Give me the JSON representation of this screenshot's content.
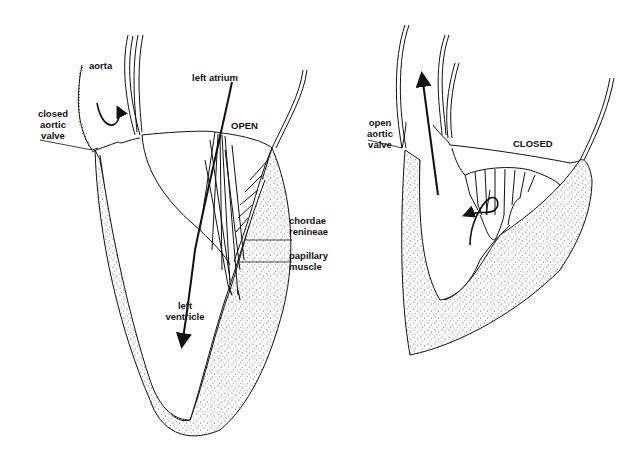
{
  "figure": {
    "colors": {
      "ink": "#111111",
      "stipple": "#444444",
      "background": "#ffffff"
    }
  },
  "left_panel": {
    "state": "diastole",
    "labels": {
      "aorta": "aorta",
      "closed_aortic_valve": [
        "closed",
        "aortic",
        "valve"
      ],
      "left_atrium": "left atrium",
      "mitral_state": "OPEN",
      "chordae": [
        "chordae",
        "renineae"
      ],
      "papillary": [
        "papillary",
        "muscle"
      ],
      "left_ventricle": [
        "left",
        "ventricle"
      ]
    }
  },
  "right_panel": {
    "state": "systole",
    "labels": {
      "open_aortic_valve": [
        "open",
        "aortic",
        "valve"
      ],
      "mitral_state": "CLOSED"
    }
  }
}
